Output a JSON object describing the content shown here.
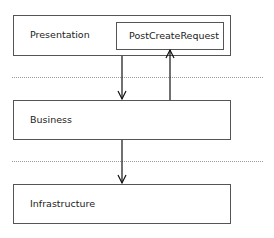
{
  "diagram": {
    "layers": [
      {
        "name": "Presentation",
        "label": "Presentation"
      },
      {
        "name": "Business",
        "label": "Business"
      },
      {
        "name": "Infrastructure",
        "label": "Infrastructure"
      }
    ],
    "component": {
      "label": "PostCreateRequest",
      "layer": "Presentation"
    },
    "arrows": [
      {
        "from": "Presentation",
        "to": "Business",
        "direction": "down"
      },
      {
        "from": "Business",
        "to": "PostCreateRequest",
        "direction": "up"
      },
      {
        "from": "Business",
        "to": "Infrastructure",
        "direction": "down"
      }
    ],
    "separators": 2,
    "colors": {
      "border": "#555555",
      "separator": "#999999",
      "arrow": "#111111"
    }
  }
}
